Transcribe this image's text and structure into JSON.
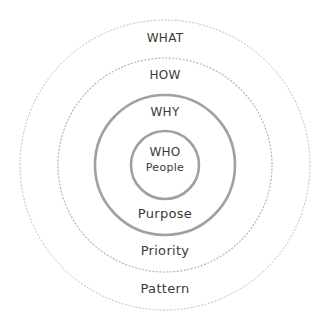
{
  "diagram": {
    "type": "concentric-circles",
    "center": [
      165,
      165
    ],
    "rings": [
      {
        "name": "outer",
        "radius": 145,
        "style": "dashed-thin",
        "color": "#b8b8b8"
      },
      {
        "name": "second",
        "radius": 107,
        "style": "dashed-thin",
        "color": "#b0b0b0"
      },
      {
        "name": "third",
        "radius": 70,
        "style": "solid-thick",
        "color": "#9a9a9a"
      },
      {
        "name": "inner",
        "radius": 34,
        "style": "solid-thick",
        "color": "#9a9a9a"
      }
    ],
    "labels": {
      "what": "WHAT",
      "how": "HOW",
      "why": "WHY",
      "who": "WHO",
      "people": "People",
      "purpose": "Purpose",
      "priority": "Priority",
      "pattern": "Pattern"
    }
  }
}
